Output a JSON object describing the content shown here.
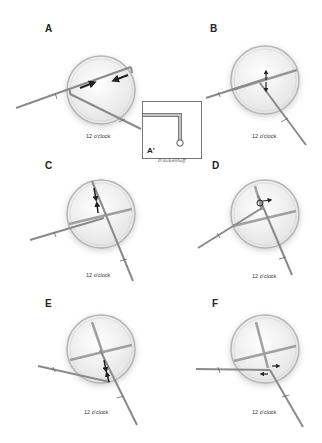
{
  "figure": {
    "panels": [
      {
        "id": "A",
        "letter": "A",
        "caption": "12 o'clock"
      },
      {
        "id": "B",
        "letter": "B",
        "caption": "12 o'clock"
      },
      {
        "id": "C",
        "letter": "C",
        "caption": "12 o'clock"
      },
      {
        "id": "D",
        "letter": "D",
        "caption": "12 o'clock"
      },
      {
        "id": "E",
        "letter": "E",
        "caption": "12 o'clock"
      },
      {
        "id": "F",
        "letter": "F",
        "caption": "12 o'clock"
      }
    ],
    "inset": {
      "label": "A'"
    },
    "signature": "D.Eckenhoff"
  },
  "colors": {
    "instrument": "#8a8a8a",
    "instrument_dark": "#555555",
    "lens_fill": "#f2f2f2",
    "lens_rim": "#b8b8b8",
    "shadow": "#9a9a9a",
    "arrow": "#222222"
  }
}
